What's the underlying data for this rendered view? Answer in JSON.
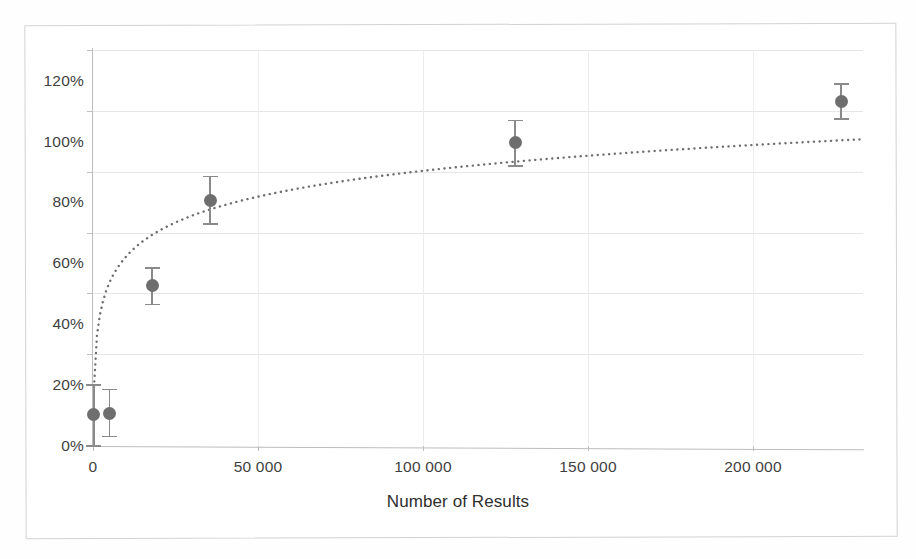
{
  "chart_data": {
    "type": "scatter",
    "title": "",
    "subtitle": "",
    "xlabel": "Number of Results",
    "ylabel": "",
    "xlim": [
      0,
      233000
    ],
    "ylim": [
      0,
      125
    ],
    "grid": true,
    "legend": "none",
    "x_tick_labels": [
      "0",
      "50 000",
      "100 000",
      "150 000",
      "200 000"
    ],
    "x_tick_values": [
      0,
      50000,
      100000,
      150000,
      200000
    ],
    "y_tick_labels": [
      "0%",
      "20%",
      "40%",
      "60%",
      "80%",
      "100%",
      "120%"
    ],
    "y_tick_values": [
      0,
      20,
      40,
      60,
      80,
      100,
      120
    ],
    "series": [
      {
        "name": "Measured recall",
        "marker": "filled-circle",
        "color": "#6e6e6e",
        "points": [
          {
            "x": 300,
            "y": 10,
            "yerr_low": 10,
            "yerr_high": 10
          },
          {
            "x": 5000,
            "y": 10.5,
            "yerr_low": 7.5,
            "yerr_high": 8
          },
          {
            "x": 17900,
            "y": 52.5,
            "yerr_low": 6,
            "yerr_high": 6
          },
          {
            "x": 35500,
            "y": 80.5,
            "yerr_low": 7.5,
            "yerr_high": 8
          },
          {
            "x": 127900,
            "y": 99.5,
            "yerr_low": 7.5,
            "yerr_high": 7.5
          },
          {
            "x": 226700,
            "y": 113,
            "yerr_low": 5.5,
            "yerr_high": 6
          }
        ]
      },
      {
        "name": "Logarithmic trend",
        "style": "dotted",
        "color": "#6e6e6e",
        "fit": "logarithmic",
        "endpoints": [
          {
            "x": 300,
            "y": 19
          },
          {
            "x": 233000,
            "y": 100.5
          }
        ]
      }
    ]
  },
  "axis": {
    "x_title": "Number of Results"
  }
}
